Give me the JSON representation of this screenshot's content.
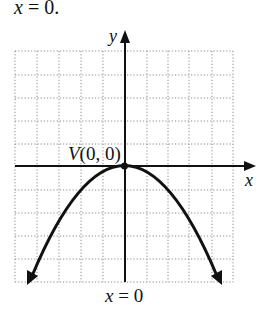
{
  "caption_top": {
    "var": "x",
    "eq": " = 0."
  },
  "axes": {
    "x_label": "x",
    "y_label": "y"
  },
  "vertex": {
    "letter": "V",
    "coords": "(0, 0)"
  },
  "axis_of_symmetry": {
    "var": "x",
    "eq": " = 0"
  },
  "grid": {
    "x_range": [
      -5,
      5
    ],
    "y_range": [
      -5,
      5
    ],
    "step": 1,
    "style": "dotted"
  },
  "curve": {
    "type": "parabola",
    "opens": "down",
    "equation_approx": "y = -x^2/4",
    "vertex": [
      0,
      0
    ],
    "endpoint_left": [
      -4.4,
      -5
    ],
    "endpoint_right": [
      4.4,
      -5
    ]
  },
  "colors": {
    "ink": "#111111",
    "grid": "#8a8a8a",
    "background": "#ffffff"
  }
}
